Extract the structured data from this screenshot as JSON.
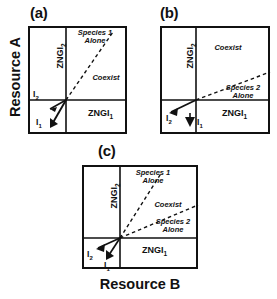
{
  "figure": {
    "axis_x_label": "Resource B",
    "axis_y_label": "Resource A"
  },
  "panels": [
    {
      "key": "a",
      "label": "(a)",
      "zngi_vertical": "ZNGI",
      "zngi_vertical_sub": "2",
      "zngi_horizontal": "ZNGI",
      "zngi_horizontal_sub": "1",
      "regions": [
        {
          "name": "species-1-alone",
          "line1": "Species 1",
          "line2": "Alone"
        },
        {
          "name": "coexist",
          "line1": "Coexist",
          "line2": ""
        }
      ],
      "vectors": [
        {
          "name": "I2",
          "base": "I",
          "sub": "2"
        },
        {
          "name": "I1",
          "base": "I",
          "sub": "1"
        }
      ]
    },
    {
      "key": "b",
      "label": "(b)",
      "zngi_vertical": "ZNGI",
      "zngi_vertical_sub": "2",
      "zngi_horizontal": "ZNGI",
      "zngi_horizontal_sub": "1",
      "regions": [
        {
          "name": "coexist",
          "line1": "Coexist",
          "line2": ""
        },
        {
          "name": "species-2-alone",
          "line1": "Species 2",
          "line2": "Alone"
        }
      ],
      "vectors": [
        {
          "name": "I2",
          "base": "I",
          "sub": "2"
        },
        {
          "name": "I1",
          "base": "I",
          "sub": "1"
        }
      ]
    },
    {
      "key": "c",
      "label": "(c)",
      "zngi_vertical": "ZNGI",
      "zngi_vertical_sub": "2",
      "zngi_horizontal": "ZNGI",
      "zngi_horizontal_sub": "1",
      "regions": [
        {
          "name": "species-1-alone",
          "line1": "Species 1",
          "line2": "Alone"
        },
        {
          "name": "coexist",
          "line1": "Coexist",
          "line2": ""
        },
        {
          "name": "species-2-alone",
          "line1": "Species 2",
          "line2": "Alone"
        }
      ],
      "vectors": [
        {
          "name": "I2",
          "base": "I",
          "sub": "2"
        },
        {
          "name": "I1",
          "base": "I",
          "sub": "1"
        }
      ]
    }
  ],
  "colors": {
    "ink": "#111111",
    "background": "#ffffff"
  }
}
